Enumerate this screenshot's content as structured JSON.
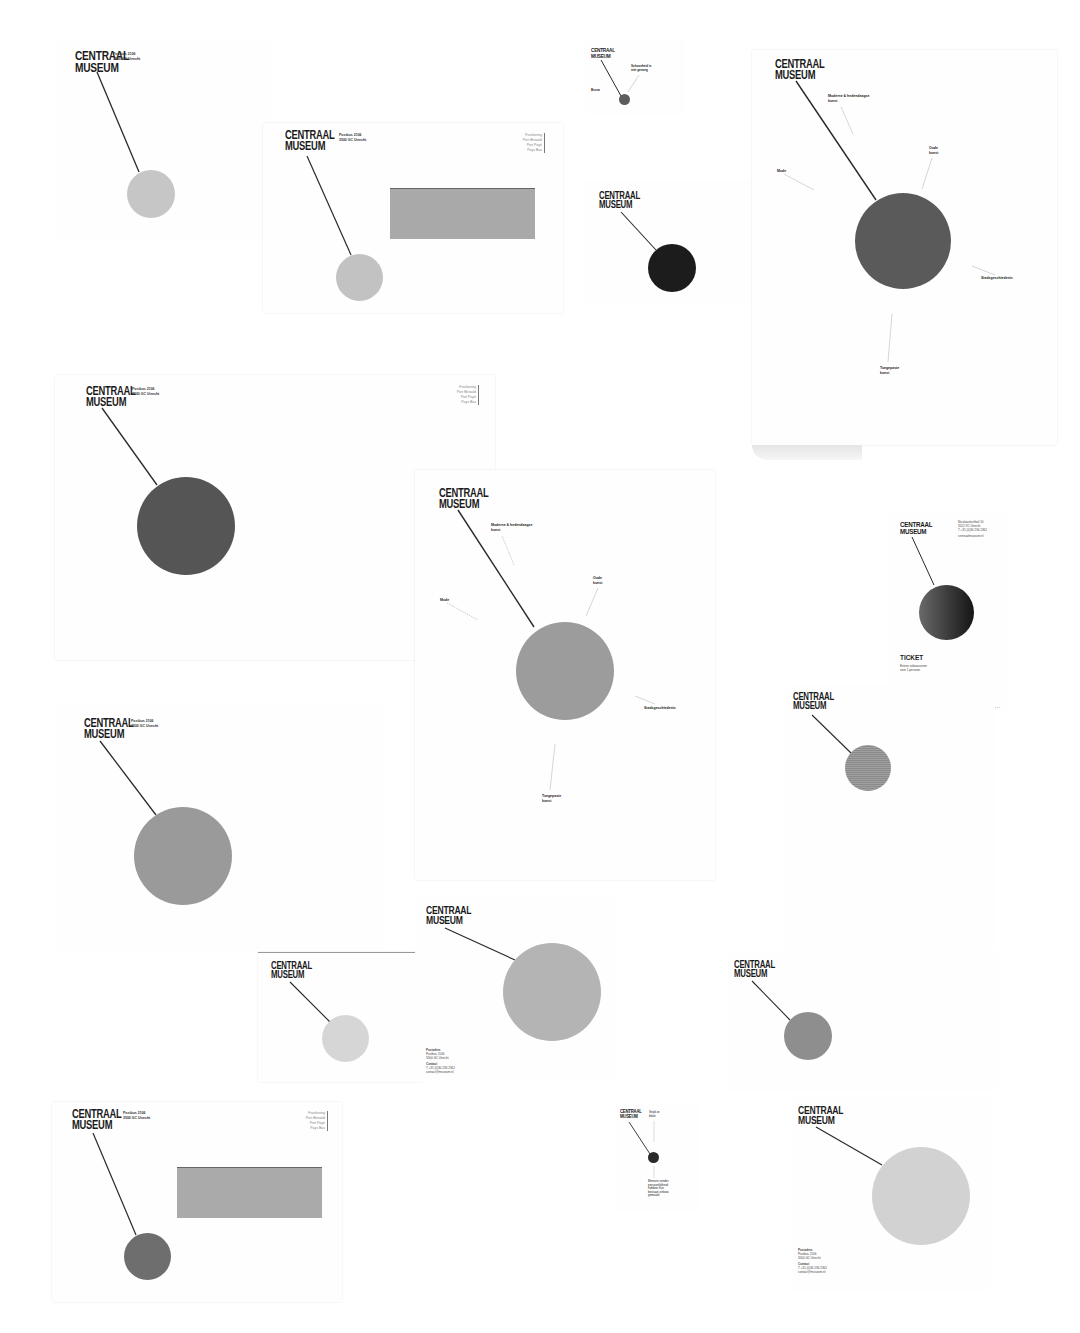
{
  "brand": {
    "logo_line1": "CENTRAAL",
    "logo_line2": "MUSEUM"
  },
  "colors": {
    "background": "#ffffff",
    "paper": "#fefefe",
    "circle_light": "#c4c4c4",
    "circle_mid": "#9a9a9a",
    "circle_dark": "#5a5a5a",
    "circle_black": "#1c1c1c",
    "window_gray": "#a9a9a9",
    "line": "#2a2a2a"
  },
  "letterhead": {
    "address_line1": "Postbus 2106",
    "address_line2": "3500 GC Utrecht"
  },
  "postage_stamp": {
    "lines": [
      "Frankering",
      "Port Betaald",
      "Port Payé",
      "Pays Bas"
    ]
  },
  "collection_labels": {
    "modern": "Moderne & hedendaagse kunst",
    "oude_kunst": "Oude kunst",
    "mode": "Mode",
    "stadsgeschiedenis": "Stadsgeschiedenis",
    "toegepaste_kunst": "Toegepaste kunst"
  },
  "small_card": {
    "label_right": "Schoonheid is niet genoeg",
    "label_left": "Bruna"
  },
  "bottom_card": {
    "label_top": "Snijd ze bloot",
    "label_bottom": "Mensen zonder persoonlijkheid hebben hun bestaan zinloos gemaakt"
  },
  "ticket": {
    "address_line1": "Nicolaaskerkhof 10",
    "address_line2": "3512 XC Utrecht",
    "address_line3": "T +31 (0)30 236 2362",
    "website": "centraalmuseum.nl",
    "title": "TICKET",
    "subtitle_line1": "Entree volwassenen",
    "subtitle_line2": "voor 1 persoon",
    "price_label": "Prijs",
    "price_value": "9 9 9 €"
  },
  "compliment_card": {
    "postal_header": "Postadres",
    "postal_line1": "Postbus 2106",
    "postal_line2": "3500 GC Utrecht",
    "contact_header": "Contact",
    "contact_phone": "T +31 (0)30 236 2362",
    "contact_email": "contact@museum.nl"
  }
}
